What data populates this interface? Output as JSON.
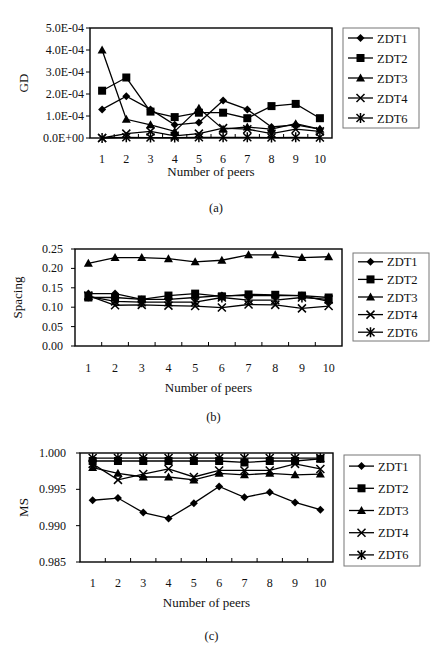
{
  "chart_data": [
    {
      "id": "a",
      "type": "line",
      "caption": "(a)",
      "title": "",
      "xlabel": "Number of peers",
      "ylabel": "GD",
      "categories": [
        "1",
        "2",
        "3",
        "4",
        "5",
        "6",
        "7",
        "8",
        "9",
        "10"
      ],
      "x": [
        1,
        2,
        3,
        4,
        5,
        6,
        7,
        8,
        9,
        10
      ],
      "ylim": [
        0,
        0.0005
      ],
      "yticks": [
        0,
        0.0001,
        0.0002,
        0.0003,
        0.0004,
        0.0005
      ],
      "ytick_labels": [
        "0.0E+00",
        "1.0E-04",
        "2.0E-04",
        "3.0E-04",
        "4.0E-04",
        "5.0E-04"
      ],
      "grid": false,
      "legend_position": "right",
      "series": [
        {
          "name": "ZDT1",
          "marker": "diamond",
          "values": [
            0.00013,
            0.00019,
            0.00013,
            6e-05,
            7e-05,
            0.00017,
            0.00013,
            5e-05,
            6e-05,
            4e-05
          ]
        },
        {
          "name": "ZDT2",
          "marker": "square",
          "values": [
            0.000215,
            0.000275,
            0.00012,
            9.5e-05,
            0.000115,
            0.000115,
            9e-05,
            0.000145,
            0.000155,
            9e-05
          ]
        },
        {
          "name": "ZDT3",
          "marker": "triangle",
          "values": [
            0.0004,
            8.5e-05,
            6e-05,
            3e-05,
            0.000135,
            4e-05,
            5e-05,
            4e-05,
            6.5e-05,
            4e-05
          ]
        },
        {
          "name": "ZDT4",
          "marker": "x",
          "values": [
            0.0,
            2e-05,
            3e-05,
            1e-05,
            2e-05,
            4.5e-05,
            4e-05,
            2e-05,
            4e-05,
            3e-05
          ]
        },
        {
          "name": "ZDT6",
          "marker": "asterisk",
          "values": [
            0.0,
            3e-06,
            2e-06,
            2e-06,
            3e-06,
            3e-06,
            3e-06,
            2e-06,
            3e-06,
            2e-06
          ]
        }
      ]
    },
    {
      "id": "b",
      "type": "line",
      "caption": "(b)",
      "title": "",
      "xlabel": "Number of peers",
      "ylabel": "Spacing",
      "categories": [
        "1",
        "2",
        "3",
        "4",
        "5",
        "6",
        "7",
        "8",
        "9",
        "10"
      ],
      "x": [
        1,
        2,
        3,
        4,
        5,
        6,
        7,
        8,
        9,
        10
      ],
      "ylim": [
        0,
        0.25
      ],
      "yticks": [
        0,
        0.05,
        0.1,
        0.15,
        0.2,
        0.25
      ],
      "ytick_labels": [
        "0.00",
        "0.05",
        "0.10",
        "0.15",
        "0.20",
        "0.25"
      ],
      "grid": false,
      "legend_position": "right",
      "series": [
        {
          "name": "ZDT1",
          "marker": "diamond",
          "values": [
            0.135,
            0.135,
            0.12,
            0.12,
            0.125,
            0.13,
            0.13,
            0.13,
            0.13,
            0.115
          ]
        },
        {
          "name": "ZDT2",
          "marker": "square",
          "values": [
            0.125,
            0.125,
            0.12,
            0.13,
            0.135,
            0.128,
            0.133,
            0.132,
            0.13,
            0.125
          ]
        },
        {
          "name": "ZDT3",
          "marker": "triangle",
          "values": [
            0.213,
            0.228,
            0.228,
            0.225,
            0.217,
            0.221,
            0.235,
            0.235,
            0.228,
            0.23
          ]
        },
        {
          "name": "ZDT4",
          "marker": "x",
          "values": [
            0.13,
            0.105,
            0.106,
            0.104,
            0.103,
            0.099,
            0.107,
            0.106,
            0.097,
            0.103
          ]
        },
        {
          "name": "ZDT6",
          "marker": "asterisk",
          "values": [
            0.128,
            0.115,
            0.113,
            0.113,
            0.113,
            0.125,
            0.118,
            0.118,
            0.125,
            0.12
          ]
        }
      ]
    },
    {
      "id": "c",
      "type": "line",
      "caption": "(c)",
      "title": "",
      "xlabel": "Number of peers",
      "ylabel": "MS",
      "categories": [
        "1",
        "2",
        "3",
        "4",
        "5",
        "6",
        "7",
        "8",
        "9",
        "10"
      ],
      "x": [
        1,
        2,
        3,
        4,
        5,
        6,
        7,
        8,
        9,
        10
      ],
      "ylim": [
        0.985,
        1.0
      ],
      "yticks": [
        0.985,
        0.99,
        0.995,
        1.0
      ],
      "ytick_labels": [
        "0.985",
        "0.990",
        "0.995",
        "1.000"
      ],
      "grid": false,
      "legend_position": "right",
      "series": [
        {
          "name": "ZDT1",
          "marker": "diamond",
          "values": [
            0.9935,
            0.9938,
            0.9918,
            0.991,
            0.9931,
            0.9954,
            0.9939,
            0.9946,
            0.9932,
            0.9922
          ]
        },
        {
          "name": "ZDT2",
          "marker": "square",
          "values": [
            0.9989,
            0.9989,
            0.9989,
            0.9989,
            0.9989,
            0.9989,
            0.9987,
            0.9989,
            0.9989,
            0.9992
          ]
        },
        {
          "name": "ZDT3",
          "marker": "triangle",
          "values": [
            0.998,
            0.9972,
            0.9967,
            0.9967,
            0.9963,
            0.9972,
            0.997,
            0.9972,
            0.997,
            0.9971
          ]
        },
        {
          "name": "ZDT4",
          "marker": "x",
          "values": [
            0.9985,
            0.9963,
            0.9971,
            0.9978,
            0.9967,
            0.9976,
            0.9976,
            0.9976,
            0.9985,
            0.9978
          ]
        },
        {
          "name": "ZDT6",
          "marker": "asterisk",
          "values": [
            0.9993,
            0.9993,
            0.9993,
            0.9993,
            0.9993,
            0.9993,
            0.9993,
            0.9993,
            0.9993,
            0.9993
          ]
        }
      ]
    }
  ],
  "layout": {
    "charts": [
      {
        "plot": {
          "x0": 90,
          "x1": 332,
          "y0": 28,
          "y1": 138
        },
        "legend": {
          "x": 343,
          "y": 28,
          "w": 76,
          "h": 100
        },
        "caption_y": 212,
        "xlabel_y": 176,
        "xtick_y": 163,
        "ylabel_x": 28,
        "ytick_x": 84
      },
      {
        "plot": {
          "x0": 75,
          "x1": 342,
          "y0": 249,
          "y1": 346
        },
        "legend": {
          "x": 353,
          "y": 253,
          "w": 76,
          "h": 88
        },
        "caption_y": 421,
        "xlabel_y": 392,
        "xtick_y": 372,
        "ylabel_x": 22,
        "ytick_x": 63
      },
      {
        "plot": {
          "x0": 80,
          "x1": 333,
          "y0": 453,
          "y1": 562
        },
        "legend": {
          "x": 344,
          "y": 455,
          "w": 76,
          "h": 111
        },
        "caption_y": 640,
        "xlabel_y": 607,
        "xtick_y": 587,
        "ylabel_x": 28,
        "ytick_x": 66
      }
    ]
  }
}
